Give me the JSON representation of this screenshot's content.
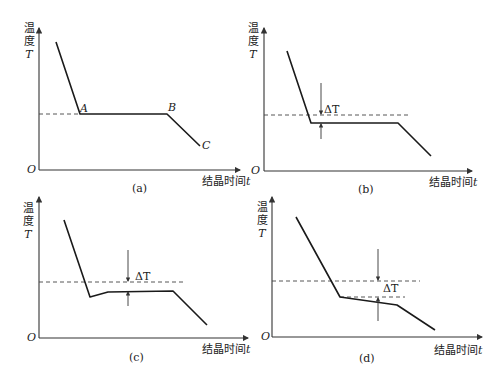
{
  "panels": [
    {
      "id": "a",
      "caption": "(a)",
      "y_label_line1": "温",
      "y_label_line2": "度",
      "y_label_var": "T",
      "x_label": "结晶时间",
      "x_label_var": "t",
      "origin": "O",
      "points": {
        "A": "A",
        "B": "B",
        "C": "C"
      }
    },
    {
      "id": "b",
      "caption": "(b)",
      "y_label_line1": "温",
      "y_label_line2": "度",
      "y_label_var": "T",
      "x_label": "结晶时间",
      "x_label_var": "t",
      "origin": "O",
      "delta": "ΔT"
    },
    {
      "id": "c",
      "caption": "(c)",
      "y_label_line1": "温",
      "y_label_line2": "度",
      "y_label_var": "T",
      "x_label": "结晶时间",
      "x_label_var": "t",
      "origin": "O",
      "delta": "ΔT"
    },
    {
      "id": "d",
      "caption": "(d)",
      "y_label_line1": "温",
      "y_label_line2": "度",
      "y_label_var": "T",
      "x_label": "结晶时间",
      "x_label_var": "t",
      "origin": "O",
      "delta": "ΔT"
    }
  ]
}
